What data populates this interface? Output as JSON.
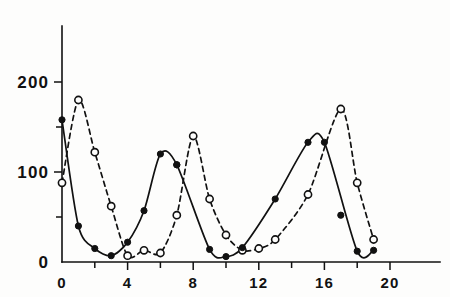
{
  "chart_data": {
    "type": "line",
    "title": "",
    "subtitle": "",
    "xlabel": "",
    "ylabel": "",
    "xlim": [
      -0.6,
      21.5
    ],
    "ylim": [
      0,
      255
    ],
    "grid": false,
    "legend": "none",
    "x_ticks_major": [
      0,
      4,
      8,
      12,
      16,
      20
    ],
    "x_ticks_minor": [
      2,
      6,
      10,
      14,
      18
    ],
    "x_tick_labels": [
      "0",
      "4",
      "8",
      "12",
      "16",
      "20"
    ],
    "y_ticks_major": [
      0,
      100,
      200
    ],
    "y_ticks_minor": [
      50,
      150
    ],
    "y_tick_labels": [
      "0",
      "100",
      "200"
    ],
    "series": [
      {
        "name": "solid-filled-circles",
        "marker": "filled-circle",
        "line_style": "solid",
        "color": "#111111",
        "x": [
          0,
          1,
          2,
          3,
          4,
          5,
          6,
          7,
          9,
          10,
          11,
          13,
          15,
          16,
          18,
          19
        ],
        "values": [
          158,
          40,
          15,
          7,
          22,
          57,
          120,
          108,
          14,
          6,
          16,
          70,
          133,
          133,
          12,
          13
        ]
      },
      {
        "name": "dashed-open-circles",
        "marker": "open-circle",
        "line_style": "dashed",
        "color": "#111111",
        "x": [
          0,
          1,
          2,
          3,
          4,
          5,
          6,
          7,
          8,
          9,
          10,
          11,
          12,
          13,
          15,
          17,
          18,
          19
        ],
        "values": [
          88,
          180,
          122,
          62,
          7,
          13,
          10,
          52,
          140,
          70,
          30,
          13,
          15,
          25,
          75,
          170,
          88,
          25
        ]
      }
    ],
    "extra_solid_points": [
      {
        "x": 7.0,
        "y": 108
      },
      {
        "x": 17.0,
        "y": 52
      }
    ]
  },
  "geometry": {
    "plot_left_px": 62,
    "plot_baseline_px": 262,
    "px_per_x_unit": 16.4,
    "px_per_100_y": 90,
    "y_axis_top_px": 26,
    "x_axis_right_px": 440
  }
}
